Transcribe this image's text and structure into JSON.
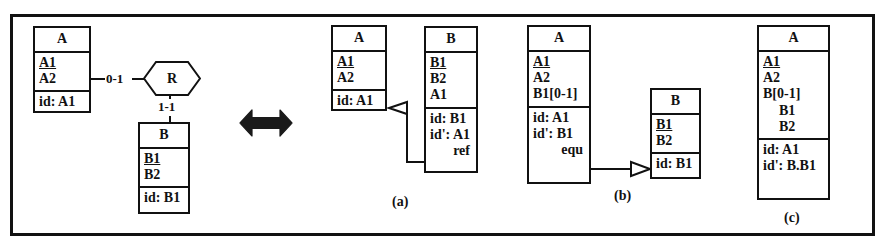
{
  "figure": {
    "equivalence_symbol": "double-headed-arrow"
  },
  "source": {
    "entity_a": {
      "name": "A",
      "attributes": [
        "A1",
        "A2"
      ],
      "identifiers": [
        "id: A1"
      ]
    },
    "relationship": {
      "name": "R",
      "role_a_cardinality": "0-1",
      "role_b_cardinality": "1-1"
    },
    "entity_b": {
      "name": "B",
      "attributes": [
        "B1",
        "B2"
      ],
      "identifiers": [
        "id: B1"
      ]
    }
  },
  "option_a": {
    "caption": "(a)",
    "entity_a": {
      "name": "A",
      "attributes": [
        "A1",
        "A2"
      ],
      "identifiers": [
        "id: A1"
      ]
    },
    "entity_b": {
      "name": "B",
      "attributes": [
        "B1",
        "B2",
        "A1"
      ],
      "identifiers": [
        "id: B1",
        "id': A1"
      ],
      "constraint": "ref"
    }
  },
  "option_b": {
    "caption": "(b)",
    "entity_a": {
      "name": "A",
      "attributes": [
        "A1",
        "A2",
        "B1[0-1]"
      ],
      "identifiers": [
        "id: A1",
        "id': B1"
      ],
      "constraint": "equ"
    },
    "entity_b": {
      "name": "B",
      "attributes": [
        "B1",
        "B2"
      ],
      "identifiers": [
        "id: B1"
      ]
    }
  },
  "option_c": {
    "caption": "(c)",
    "entity_a": {
      "name": "A",
      "attributes": [
        "A1",
        "A2",
        "B[0-1]",
        "B1",
        "B2"
      ],
      "identifiers": [
        "id: A1",
        "id': B.B1"
      ]
    }
  },
  "colors": {
    "ink": "#111111",
    "paper": "#ffffff"
  }
}
